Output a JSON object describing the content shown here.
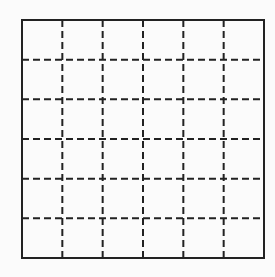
{
  "diagram": {
    "type": "grid",
    "rows": 6,
    "columns": 6,
    "outer_border": {
      "style": "solid",
      "color": "#222222",
      "width": 2
    },
    "inner_lines": {
      "style": "dashed",
      "color": "#222222",
      "width": 2,
      "dash": "7,4"
    },
    "background": "#fbfbfb",
    "bounds": {
      "left": 22,
      "top": 20,
      "right": 264,
      "bottom": 258
    }
  }
}
